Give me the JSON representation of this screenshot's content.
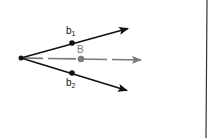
{
  "diagram": {
    "type": "vector-diagram",
    "origin": {
      "x": 21,
      "y": 58
    },
    "vectors": [
      {
        "name": "upper",
        "to": {
          "x": 129,
          "y": 28
        },
        "color": "#111111",
        "style": "solid"
      },
      {
        "name": "lower",
        "to": {
          "x": 128,
          "y": 91
        },
        "color": "#111111",
        "style": "solid"
      },
      {
        "name": "bisector",
        "to": {
          "x": 142,
          "y": 60
        },
        "color": "#7a7a7a",
        "style": "dashed"
      }
    ],
    "points": [
      {
        "id": "b1",
        "x": 72,
        "y": 43,
        "color": "#111111"
      },
      {
        "id": "B",
        "x": 81,
        "y": 59,
        "color": "#7a7a7a"
      },
      {
        "id": "b2",
        "x": 72,
        "y": 73,
        "color": "#111111"
      }
    ],
    "labels": {
      "b1_base": "b",
      "b1_sub": "1",
      "B": "B",
      "b2_base": "b",
      "b2_sub": "2"
    },
    "divider": {
      "x_top": 207,
      "x_bottom": 206,
      "color": "#333333"
    }
  }
}
